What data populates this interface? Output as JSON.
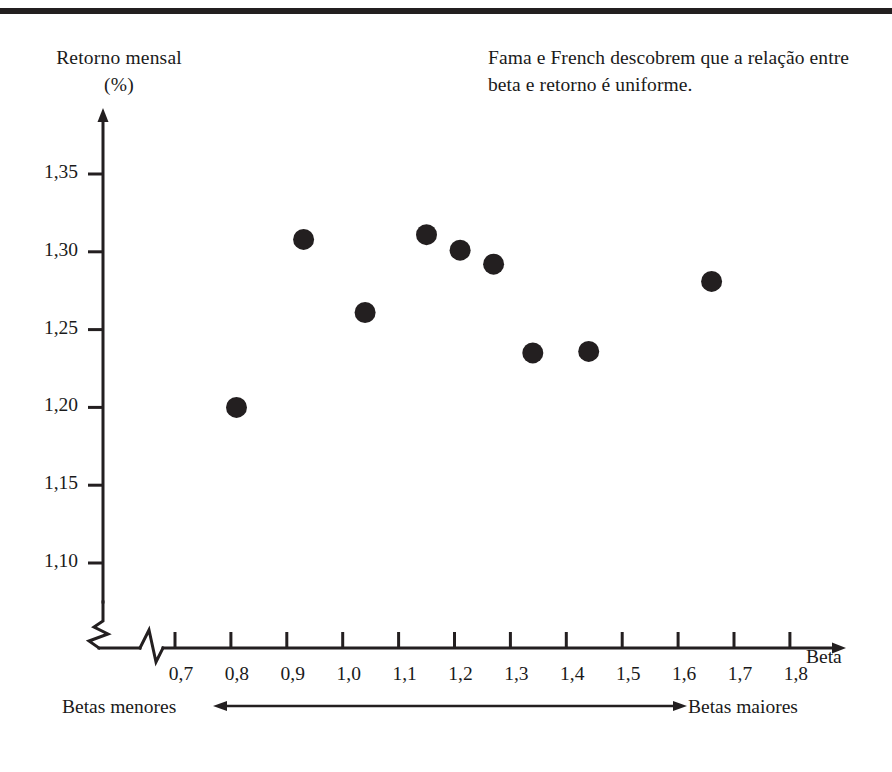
{
  "chart_data": {
    "type": "scatter",
    "title": "",
    "note": "Fama e French descobrem que a relação entre beta e retorno é uniforme.",
    "ylabel": "Retorno mensal",
    "yunit": "(%)",
    "xlabel": "Beta",
    "xticks": [
      "0,7",
      "0,8",
      "0,9",
      "1,0",
      "1,1",
      "1,2",
      "1,3",
      "1,4",
      "1,5",
      "1,6",
      "1,7",
      "1,8"
    ],
    "xtick_values": [
      0.7,
      0.8,
      0.9,
      1.0,
      1.1,
      1.2,
      1.3,
      1.4,
      1.5,
      1.6,
      1.7,
      1.8
    ],
    "yticks": [
      "1,35",
      "1,30",
      "1,25",
      "1,20",
      "1,15",
      "1,10"
    ],
    "ytick_values": [
      1.35,
      1.3,
      1.25,
      1.2,
      1.15,
      1.1
    ],
    "xlim": [
      0.7,
      1.8
    ],
    "ylim": [
      1.1,
      1.35
    ],
    "axis_break_x": true,
    "axis_break_y": true,
    "grid": false,
    "legend": "none",
    "marker": "filled-circle",
    "marker_color": "#231f20",
    "points": [
      {
        "x": 0.81,
        "y": 1.2
      },
      {
        "x": 0.93,
        "y": 1.308
      },
      {
        "x": 1.04,
        "y": 1.261
      },
      {
        "x": 1.15,
        "y": 1.311
      },
      {
        "x": 1.21,
        "y": 1.301
      },
      {
        "x": 1.27,
        "y": 1.292
      },
      {
        "x": 1.34,
        "y": 1.235
      },
      {
        "x": 1.44,
        "y": 1.236
      },
      {
        "x": 1.66,
        "y": 1.281
      }
    ],
    "footer_left": "Betas menores",
    "footer_right": "Betas maiores",
    "footer_arrow": "double-headed-arrow"
  },
  "colors": {
    "ink": "#231f20",
    "background": "#ffffff"
  }
}
